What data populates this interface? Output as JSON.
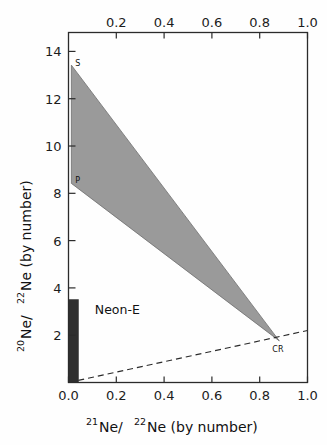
{
  "chart_data": {
    "type": "scatter",
    "title": "",
    "xlabel": "21Ne/ 22Ne (by number)",
    "xlabel_parts": {
      "sup1": "21",
      "mid": "Ne/",
      "sup2": "22",
      "tail": "Ne (by number)"
    },
    "ylabel": "20Ne/ 22Ne (by number)",
    "ylabel_parts": {
      "sup1": "20",
      "mid": "Ne/",
      "sup2": "22",
      "tail": "Ne (by number)"
    },
    "xlim": [
      0.0,
      1.0
    ],
    "ylim": [
      0.0,
      14.8
    ],
    "grid": false,
    "legend": "none",
    "x_ticks_bottom": [
      "0.0",
      "0.2",
      "0.4",
      "0.6",
      "0.8",
      "1.0"
    ],
    "x_tick_values_bottom": [
      0.0,
      0.2,
      0.4,
      0.6,
      0.8,
      1.0
    ],
    "x_ticks_top": [
      "0.2",
      "0.4",
      "0.6",
      "0.8",
      "1.0"
    ],
    "x_tick_values_top": [
      0.2,
      0.4,
      0.6,
      0.8,
      1.0
    ],
    "y_ticks": [
      "2",
      "4",
      "6",
      "8",
      "10",
      "12",
      "14"
    ],
    "y_tick_values": [
      2,
      4,
      6,
      8,
      10,
      12,
      14
    ],
    "annotations": [
      {
        "name": "S",
        "label": "S",
        "x": 0.012,
        "y": 13.4
      },
      {
        "name": "P",
        "label": "P",
        "x": 0.012,
        "y": 8.45
      },
      {
        "name": "CR",
        "label": "CR",
        "x": 0.878,
        "y": 1.78
      },
      {
        "name": "Neon-E",
        "label": "Neon-E",
        "x": 0.11,
        "y": 3.05
      }
    ],
    "shaded_region": {
      "name": "mixing-triangle",
      "fill_color": "#9a9a9a",
      "vertices": [
        {
          "label": "S",
          "x": 0.012,
          "y": 13.42
        },
        {
          "label": "CR",
          "x": 0.882,
          "y": 1.76
        },
        {
          "label": "P",
          "x": 0.012,
          "y": 8.42
        }
      ]
    },
    "dashed_line": {
      "name": "cr-mixing-line",
      "style": "dashed",
      "color": "#2b2b2b",
      "points": [
        {
          "x": 0.0,
          "y": 0.0
        },
        {
          "x": 1.0,
          "y": 2.2
        }
      ]
    },
    "bar": {
      "name": "neon-e-bar",
      "label": "Neon-E",
      "fill_color": "#2f2f2f",
      "x": 0.012,
      "y_min": 0.0,
      "y_max": 3.52,
      "width": 0.045
    },
    "series": [
      {
        "name": "Mixing triangle vertices",
        "points": [
          {
            "label": "S",
            "x": 0.012,
            "y": 13.42
          },
          {
            "label": "P",
            "x": 0.012,
            "y": 8.42
          },
          {
            "label": "CR",
            "x": 0.882,
            "y": 1.76
          }
        ]
      }
    ]
  }
}
